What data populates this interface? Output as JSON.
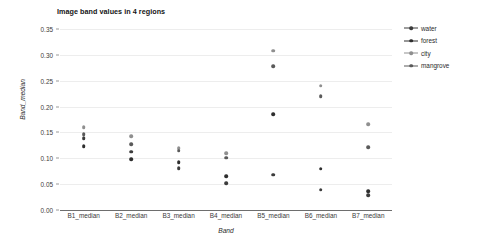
{
  "chart_data": {
    "type": "scatter",
    "title": "Image band values in 4 regions",
    "xlabel": "Band",
    "ylabel": "Band_median",
    "categories": [
      "B1_median",
      "B2_median",
      "B3_median",
      "B4_median",
      "B5_median",
      "B6_median",
      "B7_median"
    ],
    "ylim": [
      0.0,
      0.35
    ],
    "ytick_labels": [
      "0.00",
      "0.05",
      "0.10",
      "0.15",
      "0.20",
      "0.25",
      "0.30",
      "0.35"
    ],
    "ytick_values": [
      0.0,
      0.05,
      0.1,
      0.15,
      0.2,
      0.25,
      0.3,
      0.35
    ],
    "grid": "horizontal",
    "legend_position": "right",
    "series": [
      {
        "name": "water",
        "color": "#3c3c3c",
        "values": [
          0.139,
          0.113,
          0.081,
          0.052,
          0.068,
          0.039,
          0.029
        ]
      },
      {
        "name": "forest",
        "color": "#2e2e2e",
        "values": [
          0.123,
          0.098,
          0.092,
          0.065,
          0.185,
          0.08,
          0.036
        ]
      },
      {
        "name": "city",
        "color": "#8f8f8f",
        "values": [
          0.16,
          0.143,
          0.119,
          0.11,
          0.308,
          0.24,
          0.166
        ]
      },
      {
        "name": "mangrove",
        "color": "#5a5a5a",
        "values": [
          0.147,
          0.127,
          0.115,
          0.101,
          0.278,
          0.22,
          0.122
        ]
      }
    ]
  },
  "legend": {
    "entries": [
      {
        "label": "water"
      },
      {
        "label": "forest"
      },
      {
        "label": "city"
      },
      {
        "label": "mangrove"
      }
    ]
  },
  "colors": {
    "gridline": "#ededed",
    "axis_line": "#6e6e6e",
    "text": "#2a2a2a",
    "background": "#ffffff"
  }
}
